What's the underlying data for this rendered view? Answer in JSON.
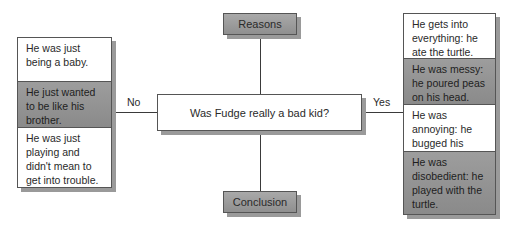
{
  "center": {
    "question": "Was Fudge really a bad kid?"
  },
  "top": {
    "label": "Reasons"
  },
  "bottom": {
    "label": "Conclusion"
  },
  "edges": {
    "left": "No",
    "right": "Yes"
  },
  "left_panel": {
    "items": [
      {
        "text": "He was just being a baby.",
        "style": "white"
      },
      {
        "text": "He just wanted to be like his brother.",
        "style": "grey"
      },
      {
        "text": "He was just playing and didn't mean to get into trouble.",
        "style": "white"
      }
    ]
  },
  "right_panel": {
    "items": [
      {
        "text": "He gets into everything: he ate the turtle.",
        "style": "white"
      },
      {
        "text": "He was messy: he poured peas on his head.",
        "style": "grey"
      },
      {
        "text": "He was annoying: he bugged his brother a lot.",
        "style": "white"
      },
      {
        "text": "He was disobedient: he played with the turtle.",
        "style": "grey"
      }
    ]
  },
  "colors": {
    "grey_fill": "#969696",
    "line": "#3a3a3a",
    "shadow": "#9a9a9a"
  }
}
